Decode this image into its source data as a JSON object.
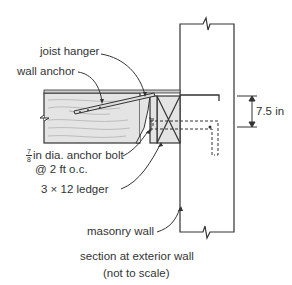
{
  "diagram": {
    "labels": {
      "joist_hanger": "joist hanger",
      "wall_anchor": "wall anchor",
      "bolt_frac_num": "7",
      "bolt_frac_den": "8",
      "anchor_bolt": "in dia. anchor bolt",
      "anchor_spacing": "@ 2 ft o.c.",
      "ledger": "3 × 12 ledger",
      "masonry_wall": "masonry wall",
      "dimension": "7.5 in"
    },
    "caption": {
      "line1": "section at exterior wall",
      "line2": "(not to scale)"
    },
    "colors": {
      "line": "#333333",
      "wood_fill": "#e4e4e4",
      "grain": "#aaaaaa"
    }
  }
}
